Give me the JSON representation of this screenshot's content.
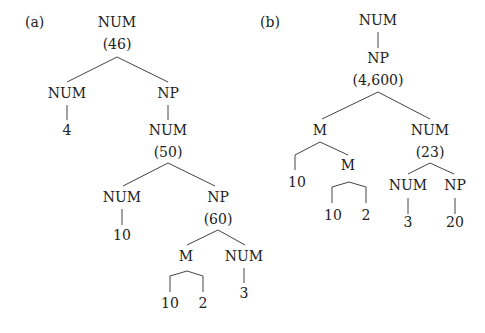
{
  "diagram_a": {
    "label": "(a)",
    "root": {
      "cat": "NUM",
      "value": "(46)"
    },
    "left_child": {
      "cat": "NUM",
      "leaf": "4"
    },
    "right_child": {
      "cat": "NP"
    },
    "num_50": {
      "cat": "NUM",
      "value": "(50)"
    },
    "num_10": {
      "cat": "NUM",
      "leaf": "10"
    },
    "np_60": {
      "cat": "NP",
      "value": "(60)"
    },
    "m": {
      "cat": "M",
      "leaves": [
        "10",
        "2"
      ]
    },
    "num_3": {
      "cat": "NUM",
      "leaf": "3"
    }
  },
  "diagram_b": {
    "label": "(b)",
    "root": {
      "cat": "NUM"
    },
    "np_4600": {
      "cat": "NP",
      "value": "(4,600)"
    },
    "m_outer": {
      "cat": "M",
      "leaf": "10"
    },
    "m_inner": {
      "cat": "M",
      "leaves": [
        "10",
        "2"
      ]
    },
    "num_23": {
      "cat": "NUM",
      "value": "(23)"
    },
    "num_3": {
      "cat": "NUM",
      "leaf": "3"
    },
    "np_20": {
      "cat": "NP",
      "leaf": "20"
    }
  }
}
